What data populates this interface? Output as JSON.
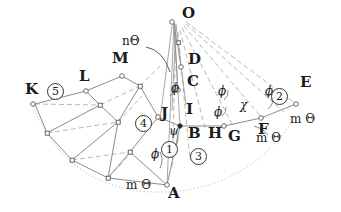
{
  "figure": {
    "type": "geometric-linkage-diagram",
    "background": "#ffffff",
    "stroke_color": "#6f6f6f",
    "label_color": "#1b1b1b",
    "width": 341,
    "height": 212
  },
  "point_labels": [
    {
      "id": "O",
      "text": "O",
      "x": 182,
      "y": 14,
      "marker": true,
      "marker_x": 172,
      "marker_y": 22
    },
    {
      "id": "D",
      "text": "D",
      "x": 188,
      "y": 60,
      "marker": true,
      "marker_x": 181,
      "marker_y": 67
    },
    {
      "id": "C",
      "text": "C",
      "x": 187,
      "y": 82,
      "marker": true,
      "marker_x": 178,
      "marker_y": 90
    },
    {
      "id": "E",
      "text": "E",
      "x": 300,
      "y": 83,
      "marker": true,
      "marker_x": 296,
      "marker_y": 104
    },
    {
      "id": "I",
      "text": "I",
      "x": 186,
      "y": 110,
      "marker": true,
      "marker_x": 180,
      "marker_y": 126
    },
    {
      "id": "B",
      "text": "B",
      "x": 188,
      "y": 126,
      "marker": false,
      "marker_x": 0,
      "marker_y": 0
    },
    {
      "id": "J",
      "text": "J",
      "x": 161,
      "y": 113,
      "marker": true,
      "marker_x": 158,
      "marker_y": 117
    },
    {
      "id": "H",
      "text": "H",
      "x": 210,
      "y": 126,
      "marker": false,
      "marker_x": 0,
      "marker_y": 0
    },
    {
      "id": "G",
      "text": "G",
      "x": 228,
      "y": 129,
      "marker": true,
      "marker_x": 224,
      "marker_y": 126
    },
    {
      "id": "F",
      "text": "F",
      "x": 258,
      "y": 122,
      "marker": true,
      "marker_x": 261,
      "marker_y": 118
    },
    {
      "id": "A",
      "text": "A",
      "x": 168,
      "y": 190,
      "marker": true,
      "marker_x": 167,
      "marker_y": 185
    },
    {
      "id": "K",
      "text": "K",
      "x": 27,
      "y": 88,
      "marker": true,
      "marker_x": 33,
      "marker_y": 104
    },
    {
      "id": "L",
      "text": "L",
      "x": 79,
      "y": 75,
      "marker": true,
      "marker_x": 86,
      "marker_y": 91
    },
    {
      "id": "M",
      "text": "M",
      "x": 113,
      "y": 57,
      "marker": true,
      "marker_x": 122,
      "marker_y": 76
    }
  ],
  "greek_labels": [
    {
      "id": "ntheta",
      "text": "nΘ",
      "x": 125,
      "y": 41,
      "style": "mt"
    },
    {
      "id": "phi-C",
      "text": "ϕ",
      "x": 172,
      "y": 88,
      "style": "gk"
    },
    {
      "id": "phi-mid",
      "text": "ϕ",
      "x": 219,
      "y": 91,
      "style": "gk"
    },
    {
      "id": "phi-mid2",
      "text": "ϕ",
      "x": 215,
      "y": 112,
      "style": "gk"
    },
    {
      "id": "chi",
      "text": "χ",
      "x": 241,
      "y": 105,
      "style": "gk"
    },
    {
      "id": "phi-E",
      "text": "ϕ",
      "x": 266,
      "y": 91,
      "style": "gk"
    },
    {
      "id": "psi-B",
      "text": "ψ",
      "x": 170,
      "y": 131,
      "style": "gk"
    },
    {
      "id": "phi-A",
      "text": "ϕ",
      "x": 152,
      "y": 154,
      "style": "gk"
    },
    {
      "id": "mtheta-A",
      "text": "m Θ",
      "x": 128,
      "y": 185,
      "style": "mt"
    },
    {
      "id": "mtheta-F",
      "text": "m Θ",
      "x": 292,
      "y": 119,
      "style": "mt"
    },
    {
      "id": "mtheta-G",
      "text": "m Θ",
      "x": 258,
      "y": 138,
      "style": "mt"
    }
  ],
  "circled_numbers": [
    {
      "id": "n1",
      "text": "1",
      "x": 168,
      "y": 148
    },
    {
      "id": "n2",
      "text": "2",
      "x": 278,
      "y": 95
    },
    {
      "id": "n3",
      "text": "3",
      "x": 197,
      "y": 155
    },
    {
      "id": "n4",
      "text": "4",
      "x": 142,
      "y": 122
    },
    {
      "id": "n5",
      "text": "5",
      "x": 54,
      "y": 90
    }
  ],
  "annotations": {
    "description": "Radial fan of construction lines emanating from apex point O, with a quadrilateral mesh network on the left side and a dotted circular arc forming the lower boundary."
  }
}
